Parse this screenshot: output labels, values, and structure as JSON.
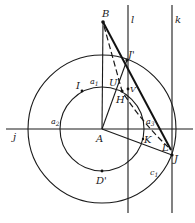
{
  "diagram": {
    "type": "geometry-construction",
    "points": [
      {
        "id": "A",
        "label": "A",
        "x": 102,
        "y": 129,
        "lx": 96,
        "ly": 140
      },
      {
        "id": "B",
        "label": "B",
        "x": 103,
        "y": 22,
        "lx": 103,
        "ly": 16
      },
      {
        "id": "Jp",
        "label": "J'",
        "x": 127,
        "y": 60,
        "lx": 129,
        "ly": 57
      },
      {
        "id": "J",
        "label": "J",
        "x": 172,
        "y": 155,
        "lx": 175,
        "ly": 160
      },
      {
        "id": "L",
        "label": "L",
        "x": 170,
        "y": 149,
        "lx": 161,
        "ly": 148
      },
      {
        "id": "K",
        "label": "K",
        "x": 142,
        "y": 141,
        "lx": 145,
        "ly": 141
      },
      {
        "id": "H",
        "label": "H",
        "x": 122,
        "y": 91,
        "lx": 116,
        "ly": 102
      },
      {
        "id": "V",
        "label": "V",
        "x": 128,
        "y": 90,
        "lx": 130,
        "ly": 88
      },
      {
        "id": "U",
        "label": "U'",
        "x": 122,
        "y": 87,
        "lx": 109,
        "ly": 84
      },
      {
        "id": "I",
        "label": "I",
        "x": 82,
        "y": 91,
        "lx": 76,
        "ly": 88
      },
      {
        "id": "Dp",
        "label": "D'",
        "x": 102,
        "y": 171,
        "lx": 96,
        "ly": 183
      }
    ],
    "labels": {
      "line_j": "j",
      "line_l": "l",
      "line_k": "k",
      "arc_a1": "a",
      "arc_a1_sub": "1",
      "arc_a2": "a",
      "arc_a2_sub": "2",
      "arc_a3": "a",
      "arc_a3_sub": "3",
      "circle_c1": "c",
      "circle_c1_sub": "1"
    },
    "circles": [
      {
        "id": "outer",
        "cx": 102,
        "cy": 129,
        "r": 74
      },
      {
        "id": "inner",
        "cx": 102,
        "cy": 129,
        "r": 42
      }
    ],
    "lines": {
      "j": {
        "x1": 6,
        "y1": 129,
        "x2": 193,
        "y2": 129
      },
      "l": {
        "x1": 128,
        "y1": 5,
        "x2": 128,
        "y2": 213
      },
      "k": {
        "x1": 172,
        "y1": 5,
        "x2": 172,
        "y2": 213
      }
    }
  }
}
